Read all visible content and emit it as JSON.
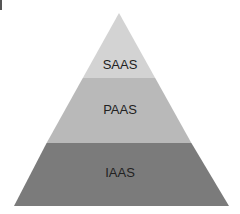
{
  "diagram": {
    "type": "pyramid",
    "layers": [
      {
        "label": "SAAS",
        "color": "#d3d3d3",
        "position": "top"
      },
      {
        "label": "PAAS",
        "color": "#b9b9b9",
        "position": "middle"
      },
      {
        "label": "IAAS",
        "color": "#7b7b7b",
        "position": "bottom"
      }
    ]
  }
}
